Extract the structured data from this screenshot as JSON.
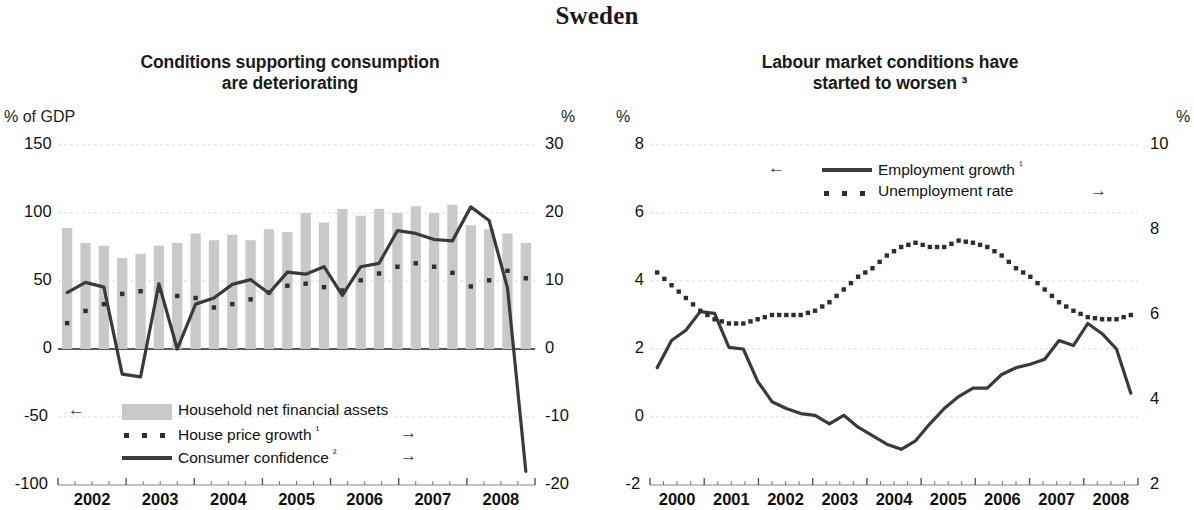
{
  "main_title": "Sweden",
  "left_panel": {
    "title_line1": "Conditions supporting consumption",
    "title_line2": "are deteriorating",
    "left_axis_label": "% of GDP",
    "right_axis_label": "%",
    "left_ticks": [
      "150",
      "100",
      "50",
      "0",
      "-50",
      "-100"
    ],
    "right_ticks": [
      "30",
      "20",
      "10",
      "0",
      "-10",
      "-20"
    ],
    "x_ticks": [
      "2002",
      "2003",
      "2004",
      "2005",
      "2006",
      "2007",
      "2008"
    ],
    "legend": [
      {
        "label": "Household net financial assets",
        "marker": "bar-swatch",
        "arrow": "left-arrow",
        "arrow_glyph": "←",
        "arrow_side": "left"
      },
      {
        "label": "House price growth ¹",
        "marker": "dotted-line",
        "arrow": "right-arrow",
        "arrow_glyph": "→",
        "arrow_side": "right"
      },
      {
        "label": "Consumer confidence ²",
        "marker": "solid-line",
        "arrow": "right-arrow",
        "arrow_glyph": "→",
        "arrow_side": "right"
      }
    ]
  },
  "right_panel": {
    "title_line1": "Labour market conditions have",
    "title_line2": "started to worsen ³",
    "left_axis_label": "%",
    "right_axis_label": "%",
    "left_ticks": [
      "8",
      "6",
      "4",
      "2",
      "0",
      "-2"
    ],
    "right_ticks": [
      "10",
      "8",
      "6",
      "4",
      "2"
    ],
    "x_ticks": [
      "2000",
      "2001",
      "2002",
      "2003",
      "2004",
      "2005",
      "2006",
      "2007",
      "2008"
    ],
    "legend": [
      {
        "label": "Employment growth ¹",
        "marker": "solid-line",
        "arrow": "left-arrow",
        "arrow_glyph": "←",
        "arrow_side": "left"
      },
      {
        "label": "Unemployment rate",
        "marker": "dotted-line",
        "arrow": "right-arrow",
        "arrow_glyph": "→",
        "arrow_side": "right"
      }
    ]
  },
  "colors": {
    "bar_fill": "#c9c9c9",
    "line_dark": "#3a3a3a",
    "dot_dark": "#2e2e2e",
    "grid": "#d8d8d8",
    "axis": "#5a5a5a",
    "text": "#151515"
  },
  "chart_data": [
    {
      "type": "bar",
      "title": "Conditions supporting consumption are deteriorating",
      "xlabel": "",
      "ylabel": "% of GDP",
      "y2label": "%",
      "ylim": [
        -100,
        150
      ],
      "y2lim": [
        -20,
        30
      ],
      "yticks": [
        -100,
        -50,
        0,
        50,
        100,
        150
      ],
      "y2ticks": [
        -20,
        -10,
        0,
        10,
        20,
        30
      ],
      "grid": true,
      "legend_position": "bottom-left",
      "x": [
        "2002Q1",
        "2002Q2",
        "2002Q3",
        "2002Q4",
        "2003Q1",
        "2003Q2",
        "2003Q3",
        "2003Q4",
        "2004Q1",
        "2004Q2",
        "2004Q3",
        "2004Q4",
        "2005Q1",
        "2005Q2",
        "2005Q3",
        "2005Q4",
        "2006Q1",
        "2006Q2",
        "2006Q3",
        "2006Q4",
        "2007Q1",
        "2007Q2",
        "2007Q3",
        "2007Q4",
        "2008Q1",
        "2008Q2"
      ],
      "xticks": [
        2002,
        2003,
        2004,
        2005,
        2006,
        2007,
        2008
      ],
      "series": [
        {
          "name": "Household net financial assets",
          "type": "bar",
          "axis": "left",
          "unit": "% of GDP",
          "values": [
            89,
            78,
            76,
            67,
            70,
            76,
            78,
            85,
            80,
            84,
            80,
            88,
            86,
            100,
            93,
            103,
            98,
            103,
            100,
            105,
            100,
            106,
            91,
            88,
            85,
            78
          ]
        },
        {
          "name": "House price growth ¹",
          "type": "dotted",
          "axis": "right",
          "unit": "%",
          "values": [
            3.8,
            5.6,
            6.6,
            8.1,
            8.5,
            8.6,
            7.8,
            7.5,
            6.1,
            6.6,
            7.3,
            8.3,
            9.3,
            9.6,
            9.1,
            8.6,
            10.1,
            11.1,
            12.1,
            12.6,
            12.1,
            11.2,
            9.2,
            10.1,
            11.5,
            10.4
          ]
        },
        {
          "name": "Consumer confidence ²",
          "type": "solid",
          "axis": "right",
          "unit": "%",
          "values": [
            8.3,
            9.8,
            9.1,
            -3.7,
            -4.1,
            9.6,
            0.0,
            6.6,
            7.5,
            9.5,
            10.2,
            8.2,
            11.3,
            11.0,
            12.1,
            7.9,
            12.1,
            12.6,
            17.4,
            17.0,
            16.1,
            15.9,
            20.9,
            18.9,
            9.0,
            -18.0
          ]
        }
      ]
    },
    {
      "type": "line",
      "title": "Labour market conditions have started to worsen ³",
      "xlabel": "",
      "ylabel": "%",
      "y2label": "%",
      "ylim": [
        -2,
        8
      ],
      "y2lim": [
        2,
        10
      ],
      "yticks": [
        -2,
        0,
        2,
        4,
        6,
        8
      ],
      "y2ticks": [
        2,
        4,
        6,
        8,
        10
      ],
      "grid": true,
      "legend_position": "top-center",
      "x": [
        "2000Q1",
        "2000Q2",
        "2000Q3",
        "2000Q4",
        "2001Q1",
        "2001Q2",
        "2001Q3",
        "2001Q4",
        "2002Q1",
        "2002Q2",
        "2002Q3",
        "2002Q4",
        "2003Q1",
        "2003Q2",
        "2003Q3",
        "2003Q4",
        "2004Q1",
        "2004Q2",
        "2004Q3",
        "2004Q4",
        "2005Q1",
        "2005Q2",
        "2005Q3",
        "2005Q4",
        "2006Q1",
        "2006Q2",
        "2006Q3",
        "2006Q4",
        "2007Q1",
        "2007Q2",
        "2007Q3",
        "2007Q4",
        "2008Q1",
        "2008Q2"
      ],
      "xticks": [
        2000,
        2001,
        2002,
        2003,
        2004,
        2005,
        2006,
        2007,
        2008
      ],
      "series": [
        {
          "name": "Employment growth ¹",
          "type": "solid",
          "axis": "left",
          "unit": "%",
          "values": [
            1.45,
            2.25,
            2.55,
            3.1,
            3.05,
            2.05,
            2.0,
            1.05,
            0.45,
            0.25,
            0.1,
            0.05,
            -0.2,
            0.05,
            -0.3,
            -0.55,
            -0.8,
            -0.95,
            -0.7,
            -0.2,
            0.25,
            0.6,
            0.85,
            0.85,
            1.25,
            1.45,
            1.55,
            1.7,
            2.25,
            2.1,
            2.75,
            2.45,
            2.0,
            0.7
          ]
        },
        {
          "name": "Unemployment rate",
          "type": "dotted",
          "axis": "right",
          "unit": "%",
          "values": [
            7.0,
            6.7,
            6.4,
            6.1,
            5.9,
            5.8,
            5.8,
            5.9,
            6.0,
            6.0,
            6.0,
            6.1,
            6.3,
            6.6,
            6.9,
            7.1,
            7.4,
            7.6,
            7.7,
            7.6,
            7.6,
            7.75,
            7.7,
            7.6,
            7.4,
            7.1,
            6.9,
            6.6,
            6.3,
            6.1,
            5.95,
            5.9,
            5.9,
            6.0
          ]
        }
      ]
    }
  ]
}
